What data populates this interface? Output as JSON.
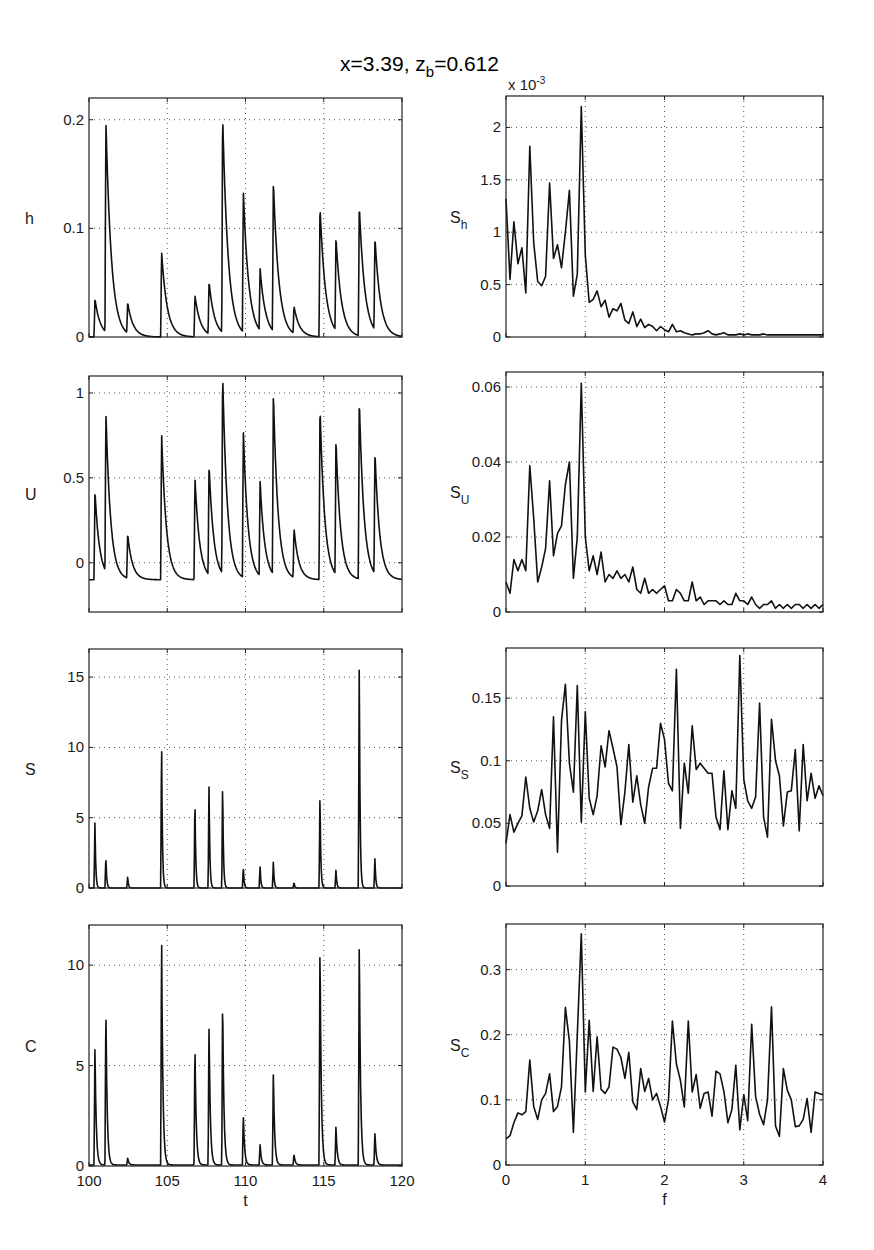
{
  "figure": {
    "title_main": "x=3.39, z",
    "title_sub": "b",
    "title_tail": "=0.612"
  },
  "chart_data": [
    {
      "id": "h",
      "type": "line",
      "ylabel": "h",
      "ylabel_sub": "",
      "xlabel": "",
      "xlim": [
        100,
        120
      ],
      "ylim": [
        0,
        0.22
      ],
      "xticks": [
        100,
        105,
        110,
        115,
        120
      ],
      "xticklabels": [],
      "yticks": [
        0,
        0.1,
        0.2
      ],
      "yticklabels": [
        "0",
        "0.1",
        "0.2"
      ],
      "grid": true,
      "peaks": [
        [
          100.38,
          0.035
        ],
        [
          101.08,
          0.195
        ],
        [
          102.47,
          0.028
        ],
        [
          104.64,
          0.078
        ],
        [
          106.77,
          0.038
        ],
        [
          107.67,
          0.048
        ],
        [
          108.54,
          0.2
        ],
        [
          109.86,
          0.13
        ],
        [
          110.93,
          0.057
        ],
        [
          111.78,
          0.138
        ],
        [
          113.1,
          0.025
        ],
        [
          114.76,
          0.12
        ],
        [
          115.78,
          0.085
        ],
        [
          117.27,
          0.12
        ],
        [
          118.27,
          0.085
        ]
      ],
      "baseline": 0,
      "decay": 0.35
    },
    {
      "id": "Sh",
      "type": "line",
      "ylabel": "S",
      "ylabel_sub": "h",
      "xlabel": "",
      "exponent_label": "x 10",
      "exponent_power": "-3",
      "xlim": [
        0,
        4
      ],
      "ylim": [
        0,
        2.3
      ],
      "xticks": [
        0,
        1,
        2,
        3,
        4
      ],
      "xticklabels": [],
      "yticks": [
        0,
        0.5,
        1,
        1.5,
        2
      ],
      "yticklabels": [
        "0",
        "0.5",
        "1",
        "1.5",
        "2"
      ],
      "grid": true,
      "x": [
        0.0,
        0.05,
        0.1,
        0.15,
        0.2,
        0.25,
        0.3,
        0.35,
        0.4,
        0.45,
        0.5,
        0.55,
        0.6,
        0.65,
        0.7,
        0.75,
        0.8,
        0.85,
        0.9,
        0.95,
        1.0,
        1.05,
        1.1,
        1.15,
        1.2,
        1.25,
        1.3,
        1.35,
        1.4,
        1.45,
        1.5,
        1.55,
        1.6,
        1.65,
        1.7,
        1.75,
        1.8,
        1.85,
        1.9,
        1.95,
        2.0,
        2.05,
        2.1,
        2.15,
        2.2,
        2.25,
        2.3,
        2.35,
        2.4,
        2.45,
        2.5,
        2.55,
        2.6,
        2.65,
        2.7,
        2.75,
        2.8,
        2.85,
        2.9,
        2.95,
        3.0,
        3.05,
        3.1,
        3.15,
        3.2,
        3.25,
        3.3,
        3.35,
        3.4,
        3.45,
        3.5,
        3.55,
        3.6,
        3.65,
        3.7,
        3.75,
        3.8,
        3.85,
        3.9,
        3.95,
        4.0
      ],
      "y": [
        1.32,
        0.55,
        1.1,
        0.7,
        0.85,
        0.42,
        1.82,
        0.9,
        0.53,
        0.49,
        0.58,
        1.47,
        0.75,
        0.88,
        0.66,
        1.0,
        1.4,
        0.39,
        0.6,
        2.2,
        0.78,
        0.33,
        0.36,
        0.44,
        0.29,
        0.35,
        0.19,
        0.27,
        0.25,
        0.32,
        0.16,
        0.13,
        0.24,
        0.1,
        0.17,
        0.09,
        0.12,
        0.1,
        0.06,
        0.1,
        0.07,
        0.05,
        0.12,
        0.05,
        0.06,
        0.04,
        0.03,
        0.02,
        0.03,
        0.03,
        0.04,
        0.06,
        0.03,
        0.02,
        0.03,
        0.04,
        0.02,
        0.02,
        0.02,
        0.03,
        0.02,
        0.03,
        0.02,
        0.02,
        0.02,
        0.03,
        0.02,
        0.02,
        0.02,
        0.02,
        0.02,
        0.02,
        0.02,
        0.02,
        0.02,
        0.02,
        0.02,
        0.02,
        0.02,
        0.02,
        0.02
      ]
    },
    {
      "id": "U",
      "type": "line",
      "ylabel": "U",
      "ylabel_sub": "",
      "xlabel": "",
      "xlim": [
        100,
        120
      ],
      "ylim": [
        -0.29,
        1.1
      ],
      "xticks": [
        100,
        105,
        110,
        115,
        120
      ],
      "xticklabels": [],
      "yticks": [
        0,
        0.5,
        1
      ],
      "yticklabels": [
        "0",
        "0.5",
        "1"
      ],
      "grid": true,
      "peaks": [
        [
          100.38,
          0.42
        ],
        [
          101.08,
          0.84
        ],
        [
          102.47,
          0.16
        ],
        [
          104.64,
          0.76
        ],
        [
          106.77,
          0.5
        ],
        [
          107.67,
          0.55
        ],
        [
          108.54,
          1.08
        ],
        [
          109.86,
          0.77
        ],
        [
          110.93,
          0.46
        ],
        [
          111.78,
          0.97
        ],
        [
          113.1,
          0.19
        ],
        [
          114.76,
          0.92
        ],
        [
          115.78,
          0.69
        ],
        [
          117.27,
          0.96
        ],
        [
          118.27,
          0.62
        ]
      ],
      "baseline": -0.1,
      "decay": 0.3
    },
    {
      "id": "SU",
      "type": "line",
      "ylabel": "S",
      "ylabel_sub": "U",
      "xlabel": "",
      "xlim": [
        0,
        4
      ],
      "ylim": [
        0,
        0.064
      ],
      "xticks": [
        0,
        1,
        2,
        3,
        4
      ],
      "xticklabels": [],
      "yticks": [
        0,
        0.02,
        0.04,
        0.06
      ],
      "yticklabels": [
        "0",
        "0.02",
        "0.04",
        "0.06"
      ],
      "grid": true,
      "x": [
        0.0,
        0.05,
        0.1,
        0.15,
        0.2,
        0.25,
        0.3,
        0.35,
        0.4,
        0.45,
        0.5,
        0.55,
        0.6,
        0.65,
        0.7,
        0.75,
        0.8,
        0.85,
        0.9,
        0.95,
        1.0,
        1.05,
        1.1,
        1.15,
        1.2,
        1.25,
        1.3,
        1.35,
        1.4,
        1.45,
        1.5,
        1.55,
        1.6,
        1.65,
        1.7,
        1.75,
        1.8,
        1.85,
        1.9,
        1.95,
        2.0,
        2.05,
        2.1,
        2.15,
        2.2,
        2.25,
        2.3,
        2.35,
        2.4,
        2.45,
        2.5,
        2.55,
        2.6,
        2.65,
        2.7,
        2.75,
        2.8,
        2.85,
        2.9,
        2.95,
        3.0,
        3.05,
        3.1,
        3.15,
        3.2,
        3.25,
        3.3,
        3.35,
        3.4,
        3.45,
        3.5,
        3.55,
        3.6,
        3.65,
        3.7,
        3.75,
        3.8,
        3.85,
        3.9,
        3.95,
        4.0
      ],
      "y": [
        0.008,
        0.005,
        0.014,
        0.011,
        0.014,
        0.011,
        0.039,
        0.025,
        0.008,
        0.012,
        0.017,
        0.035,
        0.015,
        0.021,
        0.023,
        0.034,
        0.04,
        0.009,
        0.02,
        0.061,
        0.02,
        0.011,
        0.015,
        0.01,
        0.016,
        0.008,
        0.01,
        0.009,
        0.011,
        0.009,
        0.01,
        0.008,
        0.012,
        0.006,
        0.005,
        0.009,
        0.005,
        0.006,
        0.005,
        0.006,
        0.007,
        0.003,
        0.003,
        0.006,
        0.005,
        0.003,
        0.003,
        0.008,
        0.003,
        0.004,
        0.002,
        0.003,
        0.003,
        0.003,
        0.002,
        0.003,
        0.002,
        0.002,
        0.005,
        0.003,
        0.003,
        0.002,
        0.004,
        0.002,
        0.001,
        0.002,
        0.002,
        0.003,
        0.001,
        0.002,
        0.001,
        0.002,
        0.001,
        0.002,
        0.002,
        0.001,
        0.002,
        0.001,
        0.002,
        0.001,
        0.002
      ]
    },
    {
      "id": "S",
      "type": "line",
      "ylabel": "S",
      "ylabel_sub": "",
      "xlabel": "",
      "xlim": [
        100,
        120
      ],
      "ylim": [
        0,
        17
      ],
      "xticks": [
        100,
        105,
        110,
        115,
        120
      ],
      "xticklabels": [],
      "yticks": [
        0,
        5,
        10,
        15
      ],
      "yticklabels": [
        "0",
        "5",
        "10",
        "15"
      ],
      "grid": true,
      "peaks": [
        [
          100.38,
          4.8
        ],
        [
          101.08,
          2.3
        ],
        [
          102.47,
          0.8
        ],
        [
          104.64,
          10.6
        ],
        [
          106.77,
          6.5
        ],
        [
          107.67,
          7.6
        ],
        [
          108.54,
          7.7
        ],
        [
          109.86,
          1.5
        ],
        [
          110.93,
          1.6
        ],
        [
          111.78,
          1.9
        ],
        [
          113.1,
          0.4
        ],
        [
          114.76,
          6.7
        ],
        [
          115.78,
          1.3
        ],
        [
          117.27,
          16.4
        ],
        [
          118.27,
          2.2
        ]
      ],
      "baseline": 0,
      "decay": 0.05
    },
    {
      "id": "SS",
      "type": "line",
      "ylabel": "S",
      "ylabel_sub": "S",
      "xlabel": "",
      "xlim": [
        0,
        4
      ],
      "ylim": [
        0,
        0.19
      ],
      "xticks": [
        0,
        1,
        2,
        3,
        4
      ],
      "xticklabels": [],
      "yticks": [
        0,
        0.05,
        0.1,
        0.15
      ],
      "yticklabels": [
        "0",
        "0.05",
        "0.1",
        "0.15"
      ],
      "grid": true,
      "x": [
        0.0,
        0.05,
        0.1,
        0.15,
        0.2,
        0.25,
        0.3,
        0.35,
        0.4,
        0.45,
        0.5,
        0.55,
        0.6,
        0.65,
        0.7,
        0.75,
        0.8,
        0.85,
        0.9,
        0.95,
        1.0,
        1.05,
        1.1,
        1.15,
        1.2,
        1.25,
        1.3,
        1.35,
        1.4,
        1.45,
        1.5,
        1.55,
        1.6,
        1.65,
        1.7,
        1.75,
        1.8,
        1.85,
        1.9,
        1.95,
        2.0,
        2.05,
        2.1,
        2.15,
        2.2,
        2.25,
        2.3,
        2.35,
        2.4,
        2.45,
        2.5,
        2.55,
        2.6,
        2.65,
        2.7,
        2.75,
        2.8,
        2.85,
        2.9,
        2.95,
        3.0,
        3.05,
        3.1,
        3.15,
        3.2,
        3.25,
        3.3,
        3.35,
        3.4,
        3.45,
        3.5,
        3.55,
        3.6,
        3.65,
        3.7,
        3.75,
        3.8,
        3.85,
        3.9,
        3.95,
        4.0
      ],
      "y": [
        0.034,
        0.057,
        0.043,
        0.05,
        0.056,
        0.087,
        0.062,
        0.051,
        0.06,
        0.077,
        0.057,
        0.046,
        0.135,
        0.027,
        0.132,
        0.161,
        0.098,
        0.075,
        0.16,
        0.051,
        0.139,
        0.07,
        0.057,
        0.072,
        0.112,
        0.095,
        0.124,
        0.11,
        0.095,
        0.049,
        0.075,
        0.113,
        0.067,
        0.088,
        0.065,
        0.05,
        0.079,
        0.094,
        0.094,
        0.13,
        0.117,
        0.082,
        0.076,
        0.173,
        0.046,
        0.098,
        0.074,
        0.128,
        0.093,
        0.098,
        0.094,
        0.09,
        0.09,
        0.055,
        0.045,
        0.092,
        0.045,
        0.076,
        0.062,
        0.184,
        0.085,
        0.068,
        0.062,
        0.071,
        0.146,
        0.055,
        0.039,
        0.133,
        0.1,
        0.088,
        0.048,
        0.075,
        0.076,
        0.109,
        0.044,
        0.113,
        0.068,
        0.09,
        0.07,
        0.08,
        0.072
      ]
    },
    {
      "id": "C",
      "type": "line",
      "ylabel": "C",
      "ylabel_sub": "",
      "xlabel": "t",
      "xlim": [
        100,
        120
      ],
      "ylim": [
        0,
        12
      ],
      "xticks": [
        100,
        105,
        110,
        115,
        120
      ],
      "xticklabels": [
        "100",
        "105",
        "110",
        "115",
        "120"
      ],
      "yticks": [
        0,
        5,
        10
      ],
      "yticklabels": [
        "0",
        "5",
        "10"
      ],
      "grid": true,
      "peaks": [
        [
          100.38,
          6.0
        ],
        [
          101.08,
          8.1
        ],
        [
          102.47,
          0.4
        ],
        [
          104.64,
          11.6
        ],
        [
          106.77,
          6.1
        ],
        [
          107.67,
          7.2
        ],
        [
          108.54,
          8.5
        ],
        [
          109.86,
          2.6
        ],
        [
          110.93,
          1.1
        ],
        [
          111.78,
          4.7
        ],
        [
          113.1,
          0.6
        ],
        [
          114.76,
          11.2
        ],
        [
          115.78,
          2.0
        ],
        [
          117.27,
          11.4
        ],
        [
          118.27,
          1.7
        ]
      ],
      "baseline": 0.05,
      "decay": 0.08
    },
    {
      "id": "SC",
      "type": "line",
      "ylabel": "S",
      "ylabel_sub": "C",
      "xlabel": "f",
      "xlim": [
        0,
        4
      ],
      "ylim": [
        0,
        0.37
      ],
      "xticks": [
        0,
        1,
        2,
        3,
        4
      ],
      "xticklabels": [
        "0",
        "1",
        "2",
        "3",
        "4"
      ],
      "yticks": [
        0,
        0.1,
        0.2,
        0.3
      ],
      "yticklabels": [
        "0",
        "0.1",
        "0.2",
        "0.3"
      ],
      "grid": true,
      "x": [
        0.0,
        0.05,
        0.1,
        0.15,
        0.2,
        0.25,
        0.3,
        0.35,
        0.4,
        0.45,
        0.5,
        0.55,
        0.6,
        0.65,
        0.7,
        0.75,
        0.8,
        0.85,
        0.9,
        0.95,
        1.0,
        1.05,
        1.1,
        1.15,
        1.2,
        1.25,
        1.3,
        1.35,
        1.4,
        1.45,
        1.5,
        1.55,
        1.6,
        1.65,
        1.7,
        1.75,
        1.8,
        1.85,
        1.9,
        1.95,
        2.0,
        2.05,
        2.1,
        2.15,
        2.2,
        2.25,
        2.3,
        2.35,
        2.4,
        2.45,
        2.5,
        2.55,
        2.6,
        2.65,
        2.7,
        2.75,
        2.8,
        2.85,
        2.9,
        2.95,
        3.0,
        3.05,
        3.1,
        3.15,
        3.2,
        3.25,
        3.3,
        3.35,
        3.4,
        3.45,
        3.5,
        3.55,
        3.6,
        3.65,
        3.7,
        3.75,
        3.8,
        3.85,
        3.9,
        3.95,
        4.0
      ],
      "y": [
        0.04,
        0.045,
        0.065,
        0.08,
        0.077,
        0.082,
        0.161,
        0.09,
        0.07,
        0.1,
        0.11,
        0.14,
        0.082,
        0.09,
        0.12,
        0.242,
        0.19,
        0.05,
        0.2,
        0.355,
        0.112,
        0.222,
        0.113,
        0.197,
        0.116,
        0.11,
        0.12,
        0.181,
        0.178,
        0.165,
        0.133,
        0.173,
        0.097,
        0.085,
        0.148,
        0.113,
        0.133,
        0.1,
        0.11,
        0.09,
        0.066,
        0.1,
        0.221,
        0.155,
        0.13,
        0.089,
        0.221,
        0.112,
        0.139,
        0.087,
        0.11,
        0.112,
        0.075,
        0.144,
        0.14,
        0.113,
        0.065,
        0.085,
        0.153,
        0.054,
        0.108,
        0.068,
        0.216,
        0.105,
        0.078,
        0.062,
        0.1,
        0.243,
        0.06,
        0.044,
        0.148,
        0.115,
        0.1,
        0.059,
        0.06,
        0.07,
        0.102,
        0.05,
        0.112,
        0.11,
        0.108
      ]
    }
  ]
}
